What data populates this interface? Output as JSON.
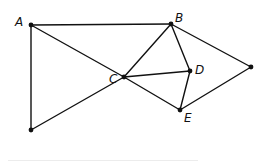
{
  "diagram": {
    "type": "geometric-figure",
    "stroke_color": "#111111",
    "points": [
      {
        "id": "A",
        "label": "A",
        "x": 31,
        "y": 25,
        "label_dx": -16,
        "label_dy": -9
      },
      {
        "id": "B",
        "label": "B",
        "x": 171,
        "y": 24,
        "label_dx": 4,
        "label_dy": -12
      },
      {
        "id": "C",
        "label": "C",
        "x": 124,
        "y": 77,
        "label_dx": -15,
        "label_dy": -4
      },
      {
        "id": "D",
        "label": "D",
        "x": 190,
        "y": 71,
        "label_dx": 5,
        "label_dy": -7
      },
      {
        "id": "E",
        "label": "E",
        "x": 180,
        "y": 110,
        "label_dx": 4,
        "label_dy": 2
      },
      {
        "id": "P",
        "label": "",
        "x": 251,
        "y": 67
      },
      {
        "id": "Q",
        "label": "",
        "x": 31,
        "y": 130
      }
    ],
    "segments": [
      [
        "A",
        "B"
      ],
      [
        "A",
        "Q"
      ],
      [
        "A",
        "C"
      ],
      [
        "C",
        "E"
      ],
      [
        "Q",
        "C"
      ],
      [
        "C",
        "B"
      ],
      [
        "C",
        "D"
      ],
      [
        "B",
        "D"
      ],
      [
        "B",
        "P"
      ],
      [
        "D",
        "E"
      ],
      [
        "E",
        "P"
      ]
    ]
  }
}
